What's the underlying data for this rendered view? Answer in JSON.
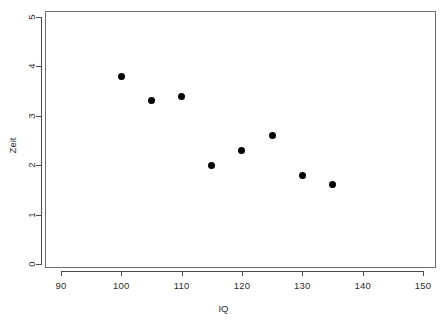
{
  "chart_data": {
    "type": "scatter",
    "title": "",
    "xlabel": "IQ",
    "ylabel": "Zeit",
    "x": [
      100,
      105,
      110,
      115,
      120,
      125,
      130,
      135
    ],
    "y": [
      3.8,
      3.3,
      3.4,
      2.0,
      2.3,
      2.6,
      1.8,
      1.6
    ],
    "xlim": [
      86,
      146
    ],
    "ylim": [
      0,
      5.2
    ],
    "xticks": [
      90,
      100,
      110,
      120,
      130,
      140,
      150
    ],
    "xtick_labels": [
      "90",
      "100",
      "110",
      "120",
      "130",
      "140",
      "150"
    ],
    "yticks": [
      0,
      1,
      2,
      3,
      4,
      5
    ],
    "ytick_labels": [
      "0",
      "1",
      "2",
      "3",
      "4",
      "5"
    ],
    "grid": false,
    "legend": null,
    "marker": "filled-circle",
    "marker_color": "#000000",
    "frame_color": "#6b6b6b",
    "background": "#ffffff",
    "points": [
      {
        "x": 100,
        "y": 3.8
      },
      {
        "x": 105,
        "y": 3.3
      },
      {
        "x": 110,
        "y": 3.4
      },
      {
        "x": 115,
        "y": 2.0
      },
      {
        "x": 120,
        "y": 2.3
      },
      {
        "x": 125,
        "y": 2.6
      },
      {
        "x": 130,
        "y": 1.8
      },
      {
        "x": 135,
        "y": 1.6
      }
    ]
  },
  "geometry": {
    "x_pixel_at_90": 61,
    "x_pixel_per_unit": 6.033,
    "y_pixel_at_0": 264,
    "y_pixel_per_unit": 49.4
  }
}
